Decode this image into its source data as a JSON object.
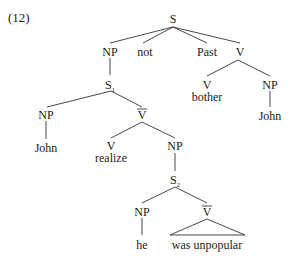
{
  "example_number": "(12)",
  "nodes": {
    "s": "S",
    "np_top": "NP",
    "not": "not",
    "past": "Past",
    "v_top": "V",
    "s1": "S",
    "s1_sub": "1",
    "v_bother": "V",
    "bother": "bother",
    "np_john_obj": "NP",
    "john_obj": "John",
    "np_john_subj": "NP",
    "john_subj": "John",
    "vbar1": "V",
    "v_realize": "V",
    "realize": "realize",
    "np_comp": "NP",
    "s2": "S",
    "s2_sub": "2",
    "np_he": "NP",
    "he": "he",
    "vbar2": "V",
    "was_unpopular": "was unpopular"
  }
}
